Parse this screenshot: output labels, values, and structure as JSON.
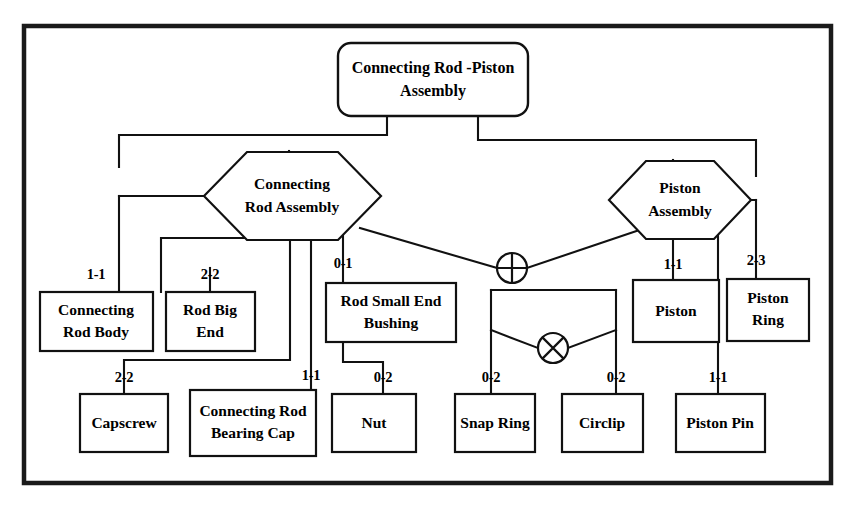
{
  "diagram": {
    "type": "assembly-breakdown",
    "border_color": "#1a1a1a",
    "line_color": "#111111",
    "background_color": "#ffffff",
    "root": {
      "id": "root",
      "shape": "rounded-rect",
      "label_line1": "Connecting Rod -Piston",
      "label_line2": "Assembly"
    },
    "assemblies": [
      {
        "id": "connecting-rod-assembly",
        "shape": "hexagon",
        "label_line1": "Connecting",
        "label_line2": "Rod Assembly"
      },
      {
        "id": "piston-assembly",
        "shape": "hexagon",
        "label_line1": "Piston",
        "label_line2": "Assembly"
      }
    ],
    "parts": [
      {
        "id": "connecting-rod-body",
        "label_line1": "Connecting",
        "label_line2": "Rod Body",
        "cardinality": "1-1",
        "parent": "connecting-rod-assembly"
      },
      {
        "id": "rod-big-end",
        "label_line1": "Rod Big",
        "label_line2": "End",
        "cardinality": "2-2",
        "parent": "connecting-rod-assembly"
      },
      {
        "id": "rod-small-end-bushing",
        "label_line1": "Rod Small End",
        "label_line2": "Bushing",
        "cardinality": "0-1",
        "parent": "connecting-rod-assembly"
      },
      {
        "id": "capscrew",
        "label_line1": "Capscrew",
        "label_line2": "",
        "cardinality": "2-2",
        "parent": "connecting-rod-assembly"
      },
      {
        "id": "connecting-rod-bearing-cap",
        "label_line1": "Connecting Rod",
        "label_line2": "Bearing Cap",
        "cardinality": "1-1",
        "parent": "connecting-rod-assembly"
      },
      {
        "id": "nut",
        "label_line1": "Nut",
        "label_line2": "",
        "cardinality": "0-2",
        "parent": "connecting-rod-assembly"
      },
      {
        "id": "snap-ring",
        "label_line1": "Snap Ring",
        "label_line2": "",
        "cardinality": "0-2",
        "parent": "xor-connector"
      },
      {
        "id": "circlip",
        "label_line1": "Circlip",
        "label_line2": "",
        "cardinality": "0-2",
        "parent": "xor-connector"
      },
      {
        "id": "piston-pin",
        "label_line1": "Piston Pin",
        "label_line2": "",
        "cardinality": "1-1",
        "parent": "piston-assembly"
      },
      {
        "id": "piston",
        "label_line1": "Piston",
        "label_line2": "",
        "cardinality": "1-1",
        "parent": "piston-assembly"
      },
      {
        "id": "piston-ring",
        "label_line1": "Piston",
        "label_line2": "Ring",
        "cardinality": "2-3",
        "parent": "piston-assembly"
      }
    ],
    "connectors": [
      {
        "id": "or-connector",
        "symbol": "circle-plus",
        "meaning": "OR"
      },
      {
        "id": "xor-connector",
        "symbol": "circle-cross",
        "meaning": "XOR"
      }
    ]
  }
}
